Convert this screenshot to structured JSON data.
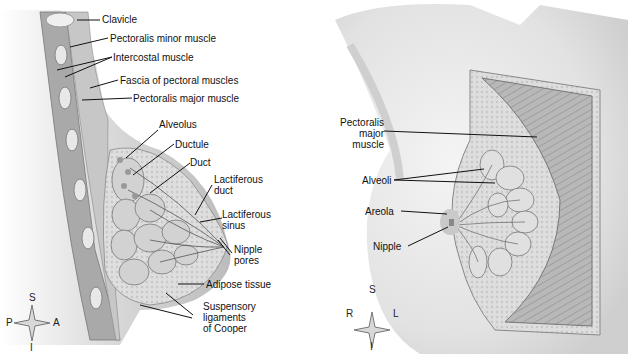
{
  "left_panel": {
    "view": "sagittal section",
    "labels": {
      "clavicle": "Clavicle",
      "pectoralis_minor": "Pectoralis minor muscle",
      "intercostal": "Intercostal muscle",
      "fascia": "Fascia of pectoral muscles",
      "pectoralis_major": "Pectoralis major muscle",
      "alveolus": "Alveolus",
      "ductule": "Ductule",
      "duct": "Duct",
      "lactiferous_duct_1": "Lactiferous",
      "lactiferous_duct_2": "duct",
      "lactiferous_sinus_1": "Lactiferous",
      "lactiferous_sinus_2": "sinus",
      "nipple_pores_1": "Nipple",
      "nipple_pores_2": "pores",
      "adipose": "Adipose tissue",
      "suspensory_1": "Suspensory",
      "suspensory_2": "ligaments",
      "suspensory_3": "of Cooper"
    },
    "compass": {
      "top": "S",
      "bottom": "I",
      "left": "P",
      "right": "A"
    }
  },
  "right_panel": {
    "view": "anterior view",
    "labels": {
      "pectoralis_1": "Pectoralis",
      "pectoralis_2": "major",
      "pectoralis_3": "muscle",
      "alveoli": "Alveoli",
      "areola": "Areola",
      "nipple": "Nipple"
    },
    "compass": {
      "top": "S",
      "bottom": "I",
      "left": "R",
      "right": "L"
    }
  }
}
